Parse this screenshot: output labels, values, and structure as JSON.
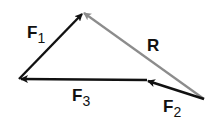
{
  "diagram": {
    "type": "vector-triangle",
    "vectors": [
      {
        "name": "F1",
        "label_main": "F",
        "label_sub": "1",
        "color": "#111111"
      },
      {
        "name": "F2",
        "label_main": "F",
        "label_sub": "2",
        "color": "#111111"
      },
      {
        "name": "F3",
        "label_main": "F",
        "label_sub": "3",
        "color": "#111111"
      },
      {
        "name": "R",
        "label_main": "R",
        "label_sub": "",
        "color": "#8c8c8c"
      }
    ]
  }
}
